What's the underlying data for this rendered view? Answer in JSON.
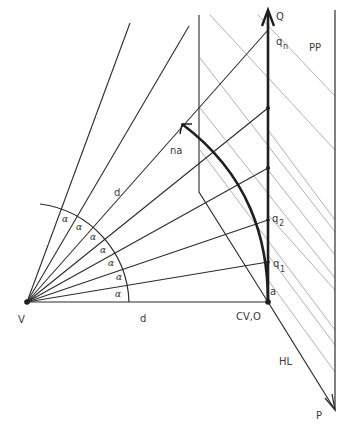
{
  "figure": {
    "type": "perspective-construction",
    "colors": {
      "ink": "#2b2b2b",
      "light_ink": "#9a9a9a",
      "background": "#ffffff"
    }
  },
  "labels": {
    "Q": "Q",
    "qn": "q",
    "qn_sub": "n",
    "PP": "PP",
    "na": "na",
    "d_ray": "d",
    "d_base": "d",
    "q2": "q",
    "q2_sub": "2",
    "q1": "q",
    "q1_sub": "1",
    "a": "a",
    "V": "V",
    "CVO": "CV,O",
    "HL": "HL",
    "P": "P"
  },
  "angles": {
    "symbol": "α",
    "count": 7,
    "items": [
      "α",
      "α",
      "α",
      "α",
      "α",
      "α",
      "α"
    ]
  }
}
